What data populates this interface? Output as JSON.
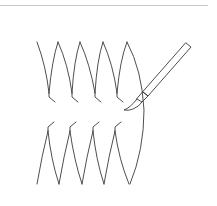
{
  "illustration": {
    "description": "Line-art diagram of stitched leaf-shaped strokes being painted with a brush",
    "stroke_color": "#3a3a3a",
    "rule_color": "#c9c9c9",
    "top_row": {
      "label": "top-row-strokes",
      "count": 4
    },
    "bottom_row": {
      "label": "bottom-row-strokes",
      "count": 4
    },
    "tool": "paint-brush"
  }
}
